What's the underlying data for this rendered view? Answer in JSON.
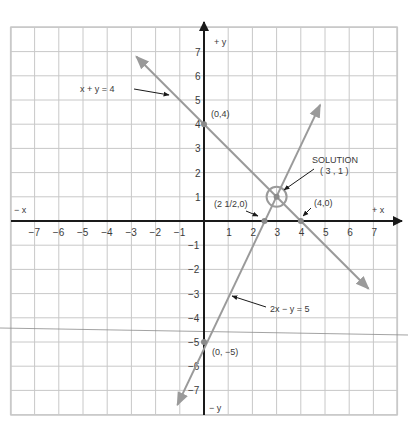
{
  "figure": {
    "title": "",
    "axes": {
      "x_pos_label": "+ x",
      "x_neg_label": "− x",
      "y_pos_label": "+ y",
      "y_neg_label": "− y",
      "x_ticks": [
        -7,
        -6,
        -5,
        -4,
        -3,
        -2,
        -1,
        1,
        2,
        3,
        4,
        5,
        6,
        7
      ],
      "x_tick_labels": [
        "−7",
        "−6",
        "−5",
        "−4",
        "−3",
        "−2",
        "−1",
        "1",
        "2",
        "3",
        "4",
        "5",
        "6",
        "7"
      ],
      "y_ticks": [
        7,
        6,
        5,
        4,
        3,
        2,
        1,
        -1,
        -2,
        -3,
        -4,
        -5,
        -6,
        -7
      ],
      "y_tick_labels": [
        "7",
        "6",
        "5",
        "4",
        "3",
        "2",
        "1",
        "−1",
        "−2",
        "−3",
        "−4",
        "−5",
        "−6",
        "−7"
      ],
      "xlim": [
        -8,
        8
      ],
      "ylim": [
        -8,
        8
      ],
      "grid": true
    },
    "lines": [
      {
        "equation": "x + y = 4",
        "label": "x  +  y  =  4",
        "from": [
          -2.8,
          6.8
        ],
        "to": [
          6.8,
          -2.8
        ],
        "color": "#9a9a9a"
      },
      {
        "equation": "2x − y = 5",
        "label": "2x  −  y  =  5",
        "from": [
          -1.1,
          -7.6
        ],
        "to": [
          4.8,
          4.8
        ],
        "color": "#9a9a9a"
      }
    ],
    "points": [
      {
        "label": "(0,4)",
        "x": 0,
        "y": 4
      },
      {
        "label": "(4,0)",
        "x": 4,
        "y": 0
      },
      {
        "label": "(2 1/2,0)",
        "x": 2.5,
        "y": 0
      },
      {
        "label": "(0, −5)",
        "x": 0,
        "y": -5
      }
    ],
    "solution": {
      "title": "SOLUTION",
      "coords_label": "( 3 , 1 )",
      "x": 3,
      "y": 1
    },
    "colors": {
      "grid": "#c8c8c8",
      "axis": "#1a1a1a",
      "line": "#9a9a9a",
      "text": "#3a3a3a"
    }
  },
  "chart_data": {
    "type": "line",
    "title": "",
    "xlabel": "x",
    "ylabel": "y",
    "xlim": [
      -8,
      8
    ],
    "ylim": [
      -8,
      8
    ],
    "grid": true,
    "series": [
      {
        "name": "x + y = 4",
        "x": [
          -2.8,
          0,
          3,
          4,
          6.8
        ],
        "y": [
          6.8,
          4,
          1,
          0,
          -2.8
        ]
      },
      {
        "name": "2x − y = 5",
        "x": [
          -1.1,
          0,
          2.5,
          3,
          4.8
        ],
        "y": [
          -7.2,
          -5,
          0,
          1,
          4.6
        ]
      }
    ],
    "annotations": [
      {
        "text": "(0,4)",
        "x": 0,
        "y": 4
      },
      {
        "text": "(4,0)",
        "x": 4,
        "y": 0
      },
      {
        "text": "(2 1/2,0)",
        "x": 2.5,
        "y": 0
      },
      {
        "text": "(0, −5)",
        "x": 0,
        "y": -5
      },
      {
        "text": "SOLUTION (3, 1)",
        "x": 3,
        "y": 1
      }
    ]
  }
}
